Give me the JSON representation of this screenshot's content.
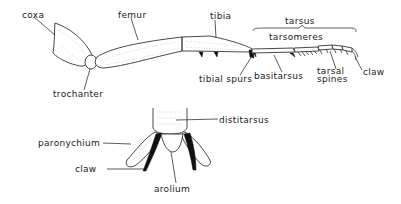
{
  "diagram": {
    "leg_labels": {
      "coxa": "coxa",
      "trochanter": "trochanter",
      "femur": "femur",
      "tibia": "tibia",
      "tibial_spurs": "tibial spurs",
      "tarsus": "tarsus",
      "tarsomeres": "tarsomeres",
      "basitarsus": "basitarsus",
      "tarsal_spines_line1": "tarsal",
      "tarsal_spines_line2": "spines",
      "claw": "claw"
    },
    "pretarsus_labels": {
      "distitarsus": "distitarsus",
      "paronychium": "paronychium",
      "claw": "claw",
      "arolium": "arolium"
    },
    "colors": {
      "line": "#333333",
      "fill": "#ffffff",
      "stipple": "#aaaaaa",
      "claw_fill": "#111111"
    }
  }
}
